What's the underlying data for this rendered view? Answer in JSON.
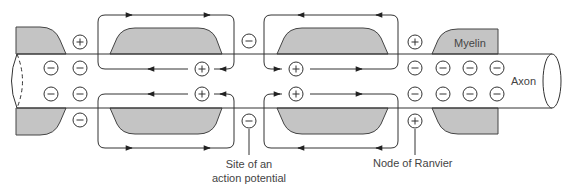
{
  "figure": {
    "type": "diagram",
    "colors": {
      "myelin_fill": "#c4c4c4",
      "stroke": "#333333",
      "background": "#ffffff"
    }
  },
  "labels": {
    "myelin": "Myelin",
    "axon": "Axon",
    "site_line1": "Site of an",
    "site_line2": "action potential",
    "node": "Node of Ranvier"
  },
  "charges": {
    "plus_symbol": "+",
    "minus_symbol": "−",
    "items": [
      {
        "x": 51,
        "y": 68,
        "sign": "minus"
      },
      {
        "x": 51,
        "y": 94,
        "sign": "minus"
      },
      {
        "x": 80,
        "y": 42,
        "sign": "plus"
      },
      {
        "x": 80,
        "y": 68,
        "sign": "minus"
      },
      {
        "x": 80,
        "y": 94,
        "sign": "minus"
      },
      {
        "x": 80,
        "y": 120,
        "sign": "minus"
      },
      {
        "x": 202,
        "y": 69,
        "sign": "plus"
      },
      {
        "x": 202,
        "y": 94,
        "sign": "plus"
      },
      {
        "x": 249,
        "y": 41,
        "sign": "minus"
      },
      {
        "x": 249,
        "y": 121,
        "sign": "minus"
      },
      {
        "x": 296,
        "y": 69,
        "sign": "plus"
      },
      {
        "x": 296,
        "y": 94,
        "sign": "plus"
      },
      {
        "x": 415,
        "y": 42,
        "sign": "plus"
      },
      {
        "x": 415,
        "y": 68,
        "sign": "minus"
      },
      {
        "x": 415,
        "y": 94,
        "sign": "minus"
      },
      {
        "x": 415,
        "y": 121,
        "sign": "plus"
      },
      {
        "x": 443,
        "y": 68,
        "sign": "minus"
      },
      {
        "x": 443,
        "y": 94,
        "sign": "minus"
      },
      {
        "x": 470,
        "y": 68,
        "sign": "minus"
      },
      {
        "x": 470,
        "y": 94,
        "sign": "minus"
      },
      {
        "x": 497,
        "y": 68,
        "sign": "minus"
      },
      {
        "x": 497,
        "y": 94,
        "sign": "minus"
      }
    ]
  }
}
